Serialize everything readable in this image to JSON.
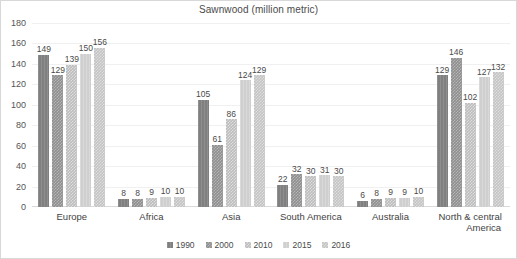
{
  "chart_data": {
    "type": "bar",
    "title": "Sawnwood (million metric)",
    "xlabel": "",
    "ylabel": "",
    "ylim": [
      0,
      180
    ],
    "yticks": [
      180,
      160,
      140,
      120,
      100,
      80,
      60,
      40,
      20,
      0
    ],
    "grid": true,
    "legend_position": "bottom",
    "data_labels": true,
    "categories": [
      "Europe",
      "Africa",
      "Asia",
      "South America",
      "Australia",
      "North & central America"
    ],
    "category_lines": [
      [
        "Europe"
      ],
      [
        "Africa"
      ],
      [
        "Asia"
      ],
      [
        "South America"
      ],
      [
        "Australia"
      ],
      [
        "North & central",
        "America"
      ]
    ],
    "series": [
      {
        "name": "1990",
        "color": "#808080",
        "values": [
          149,
          8,
          105,
          22,
          6,
          129
        ]
      },
      {
        "name": "2000",
        "color": "#8f8f8f",
        "values": [
          129,
          8,
          61,
          32,
          8,
          146
        ]
      },
      {
        "name": "2010",
        "color": "#bdbdbd",
        "values": [
          139,
          9,
          86,
          30,
          9,
          102
        ]
      },
      {
        "name": "2015",
        "color": "#cfcfcf",
        "values": [
          150,
          10,
          124,
          31,
          9,
          127
        ]
      },
      {
        "name": "2016",
        "color": "#c4c4c4",
        "values": [
          156,
          10,
          129,
          30,
          10,
          132
        ]
      }
    ]
  }
}
